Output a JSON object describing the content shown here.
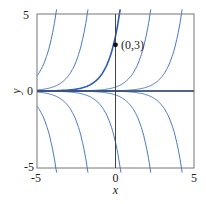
{
  "chart_data": {
    "type": "line",
    "title": "",
    "xlabel": "x",
    "ylabel": "y",
    "xlim": [
      -5,
      5
    ],
    "ylim": [
      -5,
      5
    ],
    "xticks": [
      "-5",
      "0",
      "5"
    ],
    "yticks": [
      "-5",
      "0",
      "5"
    ],
    "grid": false,
    "legend": "none",
    "series": [
      {
        "name": "upper-curve-1",
        "reaches_y5_at_x": -3.8,
        "start": [
          -5,
          0.5
        ]
      },
      {
        "name": "upper-curve-2",
        "reaches_y5_at_x": -1.8
      },
      {
        "name": "highlighted-solution",
        "reaches_y5_at_x": 0.25,
        "passes_through": [
          0,
          3
        ]
      },
      {
        "name": "upper-curve-4",
        "reaches_y5_at_x": 2.2
      },
      {
        "name": "upper-curve-5",
        "reaches_y5_at_x": 4.2
      },
      {
        "name": "lower-curve-1",
        "reaches_yneg5_at_x": -3.8,
        "start": [
          -5,
          -0.5
        ]
      },
      {
        "name": "lower-curve-2",
        "reaches_yneg5_at_x": -1.8
      },
      {
        "name": "lower-curve-3",
        "reaches_yneg5_at_x": 0.3
      },
      {
        "name": "lower-curve-4",
        "reaches_yneg5_at_x": 2.2
      },
      {
        "name": "lower-curve-5",
        "reaches_yneg5_at_x": 4.2
      },
      {
        "name": "zero-solution",
        "constant_y": 0
      }
    ],
    "annotations": [
      {
        "point": [
          0,
          3
        ],
        "label": "(0,3)"
      }
    ]
  },
  "colors": {
    "curve": "#4a78c8",
    "highlight": "#2d5bb8",
    "axis": "#555555"
  }
}
